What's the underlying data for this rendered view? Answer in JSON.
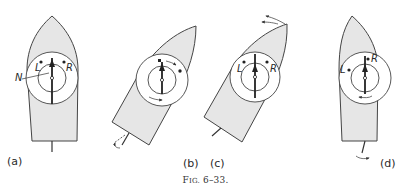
{
  "figure": {
    "caption_prefix": "F",
    "caption_smallcaps": "IG.",
    "caption_number": " 6–33.",
    "colors": {
      "hull_fill": "#e6e6e6",
      "stroke": "#444444",
      "background": "#ffffff"
    },
    "panels": [
      {
        "id": "a",
        "label": "(a)",
        "annotations": {
          "left": "L",
          "right": "R",
          "pointer": "N"
        }
      },
      {
        "id": "b",
        "label": "(b)",
        "annotations": {}
      },
      {
        "id": "c",
        "label": "(c)",
        "annotations": {
          "left": "L",
          "right": "R"
        }
      },
      {
        "id": "d",
        "label": "(d)",
        "annotations": {
          "left": "L",
          "right": "R"
        }
      }
    ]
  }
}
